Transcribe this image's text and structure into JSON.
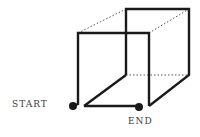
{
  "diagram": {
    "type": "wire-cube-path",
    "labels": {
      "start": "START",
      "end": "END"
    },
    "colors": {
      "line": "#1a1a1a",
      "dotted": "#555555",
      "text": "#3a3a3a"
    }
  }
}
